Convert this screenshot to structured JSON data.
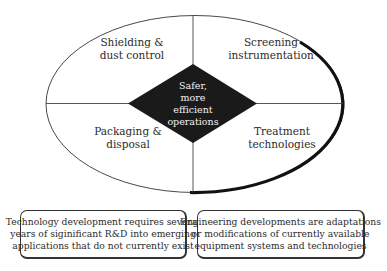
{
  "diagram": {
    "center": {
      "lines": [
        "Safer,",
        "more",
        "efficient",
        "operations"
      ]
    },
    "quadrants": {
      "top_left": {
        "lines": [
          "Shielding &",
          "dust control"
        ]
      },
      "top_right": {
        "lines": [
          "Screening",
          "instrumentation"
        ]
      },
      "bottom_left": {
        "lines": [
          "Packaging &",
          "disposal"
        ]
      },
      "bottom_right": {
        "lines": [
          "Treatment",
          "technologies"
        ]
      }
    },
    "notes": {
      "left": {
        "lines": [
          "Technology development requires several",
          "years of siginificant R&D into emerging",
          "applications that do not currently exist"
        ]
      },
      "right": {
        "lines": [
          "Engineering developments are adaptations",
          "or modifications of currently available",
          "equipment systems and technologies"
        ]
      }
    },
    "colors": {
      "stroke": "#333333",
      "diamond_fill": "#1a1a1a",
      "center_text": "#f2f2f2",
      "background": "#ffffff"
    }
  }
}
